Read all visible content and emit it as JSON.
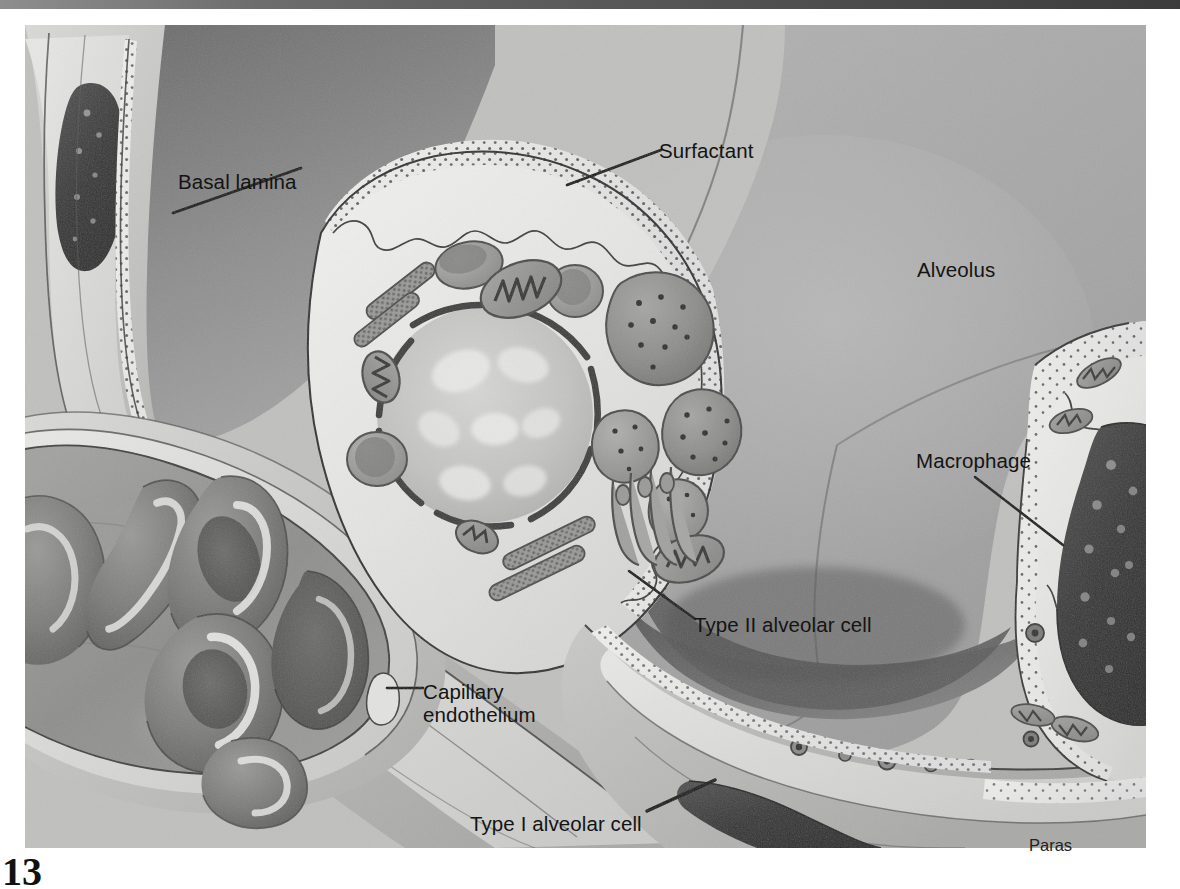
{
  "figure": {
    "kind": "histology-illustration",
    "signature": "Paras",
    "page_number": "13",
    "palette": {
      "alveolar_lumen_light": "#c6c6c6",
      "alveolar_lumen_mid": "#a8a8a8",
      "alveolar_lumen_dark": "#6f6f6f",
      "capillary_lumen": "#8b8b8b",
      "rbc_fill": "#7b7b7b",
      "rbc_shadow": "#5e5e5e",
      "cytoplasm_pale": "#e8e8e6",
      "cytoplasm_light": "#dcdcda",
      "nucleus_dense": "#3a3a3a",
      "organelle_mid": "#8a8a8a",
      "outline": "#2b2b2b",
      "label_text": "#141414",
      "leader_line": "#0d0d0d",
      "paper": "#ffffff",
      "scan_band": "#4c4c4c"
    }
  },
  "labels": [
    {
      "id": "basal-lamina",
      "text": "Basal lamina",
      "x": 178,
      "y": 170,
      "leader": "diagonal-down-left"
    },
    {
      "id": "surfactant",
      "text": "Surfactant",
      "x": 659,
      "y": 139,
      "leader": "diagonal-down-left"
    },
    {
      "id": "alveolus",
      "text": "Alveolus",
      "x": 917,
      "y": 258,
      "leader": "none"
    },
    {
      "id": "macrophage",
      "text": "Macrophage",
      "x": 916,
      "y": 449,
      "leader": "diagonal-down-right"
    },
    {
      "id": "type-ii-cell",
      "text": "Type II alveolar cell",
      "x": 694,
      "y": 613,
      "leader": "diagonal-up-left"
    },
    {
      "id": "capillary-endothelium",
      "text": "Capillary\nendothelium",
      "x": 423,
      "y": 680,
      "leader": "short-horizontal-left"
    },
    {
      "id": "type-i-cell",
      "text": "Type I alveolar cell",
      "x": 470,
      "y": 812,
      "leader": "short-diagonal-up-right"
    }
  ],
  "structures": [
    {
      "id": "alveolus-lumen",
      "name": "Alveolus (air space)"
    },
    {
      "id": "type-ii-alveolar-cell",
      "name": "Type II alveolar cell (great alveolar cell)"
    },
    {
      "id": "type-i-alveolar-cell",
      "name": "Type I alveolar cell (squamous pneumocyte)"
    },
    {
      "id": "alveolar-macrophage",
      "name": "Alveolar macrophage (dust cell)"
    },
    {
      "id": "capillary",
      "name": "Pulmonary capillary with erythrocytes"
    },
    {
      "id": "capillary-endothelium",
      "name": "Capillary endothelium"
    },
    {
      "id": "basal-lamina",
      "name": "Basal lamina"
    },
    {
      "id": "surfactant-layer",
      "name": "Surfactant layer"
    },
    {
      "id": "nucleus",
      "name": "Nucleus of type II cell"
    },
    {
      "id": "lamellar-bodies",
      "name": "Lamellar bodies (surfactant granules)"
    },
    {
      "id": "mitochondria",
      "name": "Mitochondria"
    },
    {
      "id": "rough-er",
      "name": "Rough endoplasmic reticulum"
    },
    {
      "id": "golgi",
      "name": "Golgi apparatus"
    }
  ]
}
